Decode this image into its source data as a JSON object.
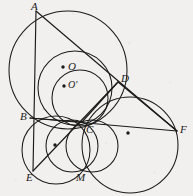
{
  "figure": {
    "type": "geometry-diagram",
    "title": "",
    "width": 193,
    "height": 196,
    "background_color": "#f2f0ee",
    "stroke_color": "#1a1a1a",
    "label_color": "#1a1a1a",
    "points": [
      {
        "id": "A",
        "label": "A",
        "x": 36,
        "y": 11,
        "label_x": 31,
        "label_y": 1,
        "marked": false
      },
      {
        "id": "B",
        "label": "B",
        "x": 30,
        "y": 118,
        "label_x": 20,
        "label_y": 111,
        "marked": false
      },
      {
        "id": "C",
        "label": "C",
        "x": 82,
        "y": 122,
        "label_x": 86,
        "label_y": 124,
        "marked": false
      },
      {
        "id": "D",
        "label": "D",
        "x": 118,
        "y": 82,
        "label_x": 121,
        "label_y": 73,
        "marked": false
      },
      {
        "id": "E",
        "label": "E",
        "x": 33,
        "y": 171,
        "label_x": 26,
        "label_y": 172,
        "marked": false
      },
      {
        "id": "F",
        "label": "F",
        "x": 177,
        "y": 131,
        "label_x": 180,
        "label_y": 124,
        "marked": false
      },
      {
        "id": "M",
        "label": "M",
        "x": 81,
        "y": 171,
        "label_x": 76,
        "label_y": 172,
        "marked": false
      },
      {
        "id": "O",
        "label": "O",
        "x": 63,
        "y": 67,
        "label_x": 68,
        "label_y": 61,
        "marked": true
      },
      {
        "id": "Op",
        "label": "O'",
        "x": 64,
        "y": 86,
        "label_x": 68,
        "label_y": 80,
        "marked": true
      }
    ],
    "center_dots": [
      {
        "id": "center-bce",
        "x": 55,
        "y": 145
      },
      {
        "id": "center-cmf",
        "x": 128,
        "y": 133
      },
      {
        "id": "center-O",
        "x": 63,
        "y": 67
      },
      {
        "id": "center-Op",
        "x": 64,
        "y": 86
      }
    ],
    "circles": [
      {
        "id": "circumcircle-ABD",
        "cx": 68,
        "cy": 70,
        "r": 59
      },
      {
        "id": "incircle-O",
        "cx": 75,
        "cy": 88,
        "r": 37
      },
      {
        "id": "circle-BCE",
        "cx": 56,
        "cy": 150,
        "r": 34
      },
      {
        "id": "circle-CMF",
        "cx": 130,
        "cy": 145,
        "r": 48
      },
      {
        "id": "circle-BCD",
        "cx": 80,
        "cy": 98,
        "r": 28
      },
      {
        "id": "circle-CDM-left",
        "cx": 72,
        "cy": 146,
        "r": 26
      },
      {
        "id": "circle-CM-lens",
        "cx": 92,
        "cy": 146,
        "r": 26
      }
    ],
    "segments": [
      {
        "id": "seg-A-E",
        "from": "A",
        "to": "E"
      },
      {
        "id": "seg-A-F",
        "from": "A",
        "to": "F"
      },
      {
        "id": "seg-B-F",
        "from": "B",
        "to": "F"
      },
      {
        "id": "seg-D-E",
        "from": "D",
        "to": "E"
      },
      {
        "id": "seg-D-C",
        "from": "D",
        "to": "C"
      },
      {
        "id": "seg-B-C",
        "from": "B",
        "to": "C"
      },
      {
        "id": "seg-D-F",
        "from": "D",
        "to": "F"
      }
    ]
  }
}
